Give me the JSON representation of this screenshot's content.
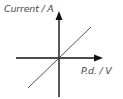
{
  "diagram": {
    "type": "current-voltage graph",
    "y_axis": {
      "label": "Current / A",
      "arrow": "up"
    },
    "x_axis": {
      "label": "P.d. / V",
      "arrow": "right"
    },
    "line": {
      "description": "straight line through origin",
      "relationship": "proportional"
    },
    "colors": {
      "axis": "#111111",
      "line": "#555555",
      "label": "#4a4a4a",
      "background": "#ffffff"
    }
  }
}
